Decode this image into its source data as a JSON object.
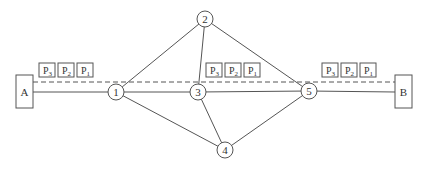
{
  "diagram": {
    "title": "",
    "hosts": [
      {
        "id": "A",
        "label": "A",
        "x": 16,
        "y": 75,
        "w": 17,
        "h": 33
      },
      {
        "id": "B",
        "label": "B",
        "x": 395,
        "y": 75,
        "w": 17,
        "h": 33
      }
    ],
    "nodes": [
      {
        "id": "1",
        "label": "1",
        "cx": 116,
        "cy": 92
      },
      {
        "id": "2",
        "label": "2",
        "cx": 205,
        "cy": 19
      },
      {
        "id": "3",
        "label": "3",
        "cx": 198,
        "cy": 92
      },
      {
        "id": "4",
        "label": "4",
        "cx": 225,
        "cy": 150
      },
      {
        "id": "5",
        "label": "5",
        "cx": 309,
        "cy": 91
      }
    ],
    "edges": [
      [
        "A",
        "1"
      ],
      [
        "1",
        "3"
      ],
      [
        "3",
        "5"
      ],
      [
        "5",
        "B"
      ],
      [
        "1",
        "2"
      ],
      [
        "2",
        "3"
      ],
      [
        "2",
        "5"
      ],
      [
        "1",
        "4"
      ],
      [
        "3",
        "4"
      ],
      [
        "4",
        "5"
      ]
    ],
    "packet_path": {
      "style": "dashed",
      "from": "A",
      "to": "B",
      "y": 82
    },
    "packet_groups": [
      {
        "x": 39,
        "packets": [
          "P3",
          "P2",
          "P1"
        ]
      },
      {
        "x": 206,
        "packets": [
          "P3",
          "P2",
          "P1"
        ]
      },
      {
        "x": 322,
        "packets": [
          "P3",
          "P2",
          "P1"
        ]
      }
    ]
  }
}
